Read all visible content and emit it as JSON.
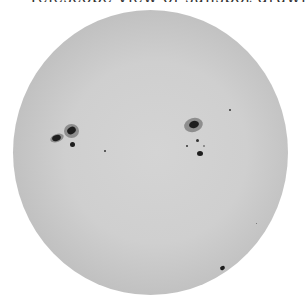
{
  "caption": {
    "text": "Telescope view of sunspot drawing"
  },
  "image": {
    "subject": "solar disc with sunspots",
    "disc_color": "#cfcfcf",
    "limb_color": "#9a9a9a",
    "umbra_color": "#1e1e1e",
    "penumbra_color": "#8e8e8e"
  },
  "sunspots": [
    {
      "group": "left",
      "x": 56,
      "y": 138,
      "size": "medium"
    },
    {
      "group": "left",
      "x": 71,
      "y": 131,
      "size": "large"
    },
    {
      "group": "left",
      "x": 72,
      "y": 145,
      "size": "small"
    },
    {
      "group": "center",
      "x": 105,
      "y": 151,
      "size": "tiny"
    },
    {
      "group": "right",
      "x": 193,
      "y": 125,
      "size": "large"
    },
    {
      "group": "right",
      "x": 197,
      "y": 140,
      "size": "tiny"
    },
    {
      "group": "right",
      "x": 187,
      "y": 146,
      "size": "tiny"
    },
    {
      "group": "right",
      "x": 204,
      "y": 146,
      "size": "tiny"
    },
    {
      "group": "right",
      "x": 200,
      "y": 154,
      "size": "small"
    },
    {
      "group": "right",
      "x": 230,
      "y": 110,
      "size": "tiny"
    },
    {
      "group": "limb",
      "x": 223,
      "y": 268,
      "size": "small"
    }
  ]
}
